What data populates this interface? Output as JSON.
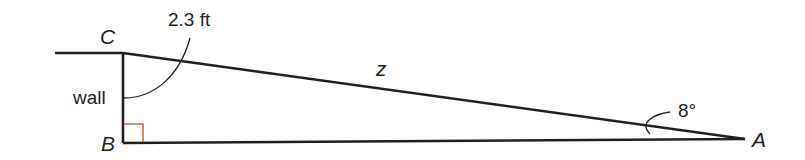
{
  "diagram": {
    "type": "right-triangle",
    "vertices": {
      "C": {
        "label": "C",
        "x": 123,
        "y": 53
      },
      "B": {
        "label": "B",
        "x": 123,
        "y": 143
      },
      "A": {
        "label": "A",
        "x": 744,
        "y": 139
      }
    },
    "labels": {
      "vertex_c": "C",
      "vertex_b": "B",
      "vertex_a": "A",
      "side_cb": "wall",
      "side_ca": "z",
      "measure_cb": "2.3 ft",
      "angle_a": "8°"
    },
    "colors": {
      "stroke": "#231f20",
      "right_angle_marker": "#e0643a"
    }
  }
}
